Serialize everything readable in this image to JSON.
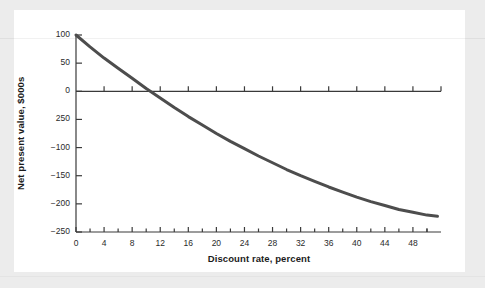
{
  "figure": {
    "background_color": "#ececec",
    "paper_color": "#ffffff",
    "axis_color": "#3a3a3a",
    "curve_color": "#4d4d4d",
    "text_color": "#1b1b1b"
  },
  "chart_data": {
    "type": "line",
    "title": "",
    "xlabel": "Discount rate, percent",
    "ylabel": "Net present value, $000s",
    "xlim": [
      0,
      52
    ],
    "ylim": [
      -250,
      100
    ],
    "grid": false,
    "legend": null,
    "x_ticks": [
      0,
      4,
      8,
      12,
      16,
      20,
      24,
      28,
      32,
      36,
      40,
      44,
      48
    ],
    "x_tick_labels": [
      "0",
      "4",
      "8",
      "12",
      "16",
      "20",
      "24",
      "28",
      "32",
      "36",
      "40",
      "44",
      "48"
    ],
    "x_minor_tick_step": 2,
    "y_ticks": [
      100,
      50,
      0,
      -50,
      -100,
      -150,
      -200,
      -250
    ],
    "y_tick_labels": [
      "100",
      "50",
      "0",
      "250",
      "−100",
      "−150",
      "−200",
      "−250"
    ],
    "zero_line": true,
    "series": [
      {
        "name": "Net present value",
        "x": [
          0,
          2,
          4,
          6,
          8,
          10,
          12,
          14,
          16,
          18,
          20,
          22,
          24,
          26,
          28,
          30,
          32,
          34,
          36,
          38,
          40,
          42,
          44,
          46,
          48,
          50,
          51.5
        ],
        "y": [
          100,
          79,
          59,
          41,
          23,
          5,
          -12,
          -29,
          -45,
          -60,
          -75,
          -89,
          -102,
          -115,
          -127,
          -139,
          -150,
          -160,
          -170,
          -179,
          -188,
          -196,
          -203,
          -210,
          -215,
          -220,
          -222
        ]
      }
    ],
    "annotations": [
      {
        "text": "zero crossing (IRR)",
        "x": 10.5,
        "y": 0
      }
    ]
  }
}
